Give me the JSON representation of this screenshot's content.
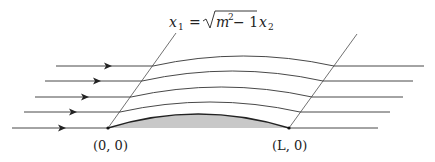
{
  "figure": {
    "equation": {
      "lhs": "x",
      "lhs_sub": "1",
      "equals": "=",
      "sqrt_arg": "m",
      "sqrt_sup": "2",
      "sqrt_rest": " − 1",
      "rhs": "x",
      "rhs_sub": "2"
    },
    "points": [
      {
        "label": "(0, 0)",
        "x": 108,
        "y": 128
      },
      {
        "label": "(L, 0)",
        "x": 289,
        "y": 128
      }
    ],
    "colors": {
      "line": "#333333",
      "airfoil_fill": "#c8c8c8"
    },
    "streamlines": [
      {
        "y": 128,
        "x_start": 12,
        "x_end": 378,
        "arrow_x": 62
      },
      {
        "y": 112,
        "x_start": 24,
        "x_end": 390,
        "arrow_x": 73
      },
      {
        "y": 97,
        "x_start": 35,
        "x_end": 403,
        "arrow_x": 85
      },
      {
        "y": 81,
        "x_start": 45,
        "x_end": 413,
        "arrow_x": 97
      },
      {
        "y": 66,
        "x_start": 56,
        "x_end": 424,
        "arrow_x": 108
      }
    ]
  }
}
